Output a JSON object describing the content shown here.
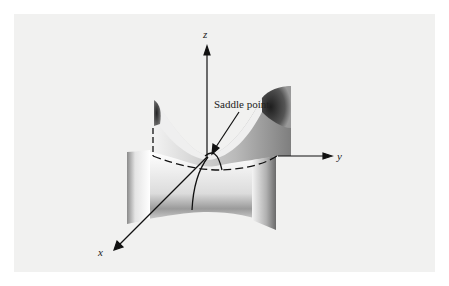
{
  "figure": {
    "annotation": "Saddle point",
    "axes": {
      "x": {
        "label": "x"
      },
      "y": {
        "label": "y"
      },
      "z": {
        "label": "z"
      }
    },
    "colors": {
      "background": "#f1f1f0",
      "surface_light": "#ffffff",
      "surface_dark": "#555555",
      "line": "#111111"
    }
  }
}
